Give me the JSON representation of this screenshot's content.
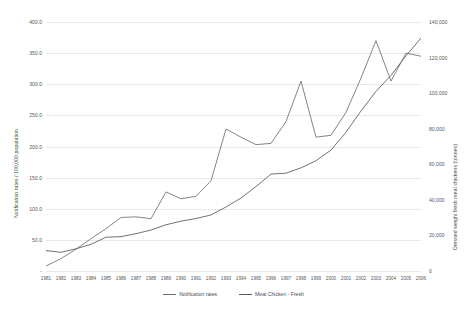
{
  "chart_data": {
    "type": "line",
    "title": "",
    "xlabel": "",
    "ylabel": "Notification rates / 100,000 population",
    "y2label": "Dressed weight fresh meat chickens (tonnes)",
    "grid": true,
    "legend_position": "bottom",
    "categories": [
      "1981",
      "1982",
      "1983",
      "1984",
      "1985",
      "1986",
      "1987",
      "1988",
      "1989",
      "1990",
      "1991",
      "1992",
      "1993",
      "1994",
      "1995",
      "1996",
      "1997",
      "1998",
      "1999",
      "2000",
      "2001",
      "2002",
      "2003",
      "2004",
      "2005",
      "2006"
    ],
    "ylim": [
      0,
      400
    ],
    "y2lim": [
      0,
      140000
    ],
    "yticks": [
      "-",
      "50.0",
      "100.0",
      "150.0",
      "200.0",
      "250.0",
      "300.0",
      "350.0",
      "400.0"
    ],
    "y2ticks": [
      "0",
      "20,000",
      "40,000",
      "60,000",
      "80,000",
      "100,000",
      "120,000",
      "140,000"
    ],
    "series": [
      {
        "name": "Notification rates",
        "axis": "left",
        "color": "#6e6e6e",
        "values": [
          8,
          20,
          35,
          52,
          68,
          86,
          87,
          84,
          127,
          116,
          120,
          145,
          228,
          215,
          203,
          205,
          240,
          305,
          215,
          218,
          255,
          310,
          370,
          305,
          350,
          345
        ]
      },
      {
        "name": "Meat Chicken - Fresh",
        "axis": "right",
        "color": "#595959",
        "values": [
          11500,
          10500,
          12500,
          15000,
          19000,
          19300,
          21000,
          23000,
          26000,
          28000,
          29500,
          31500,
          36000,
          41000,
          47500,
          54500,
          55000,
          58000,
          62000,
          68000,
          78000,
          90000,
          101000,
          110000,
          121000,
          131000
        ]
      }
    ]
  },
  "legend": {
    "items": [
      {
        "label": "Notification rates"
      },
      {
        "label": "Meat Chicken - Fresh"
      }
    ]
  }
}
